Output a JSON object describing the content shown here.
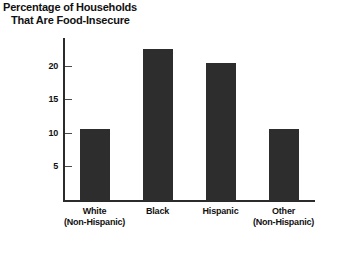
{
  "chart_data": {
    "type": "bar",
    "title": "Percentage of Households That Are Food-Insecure",
    "title_line1": "Percentage of Households",
    "title_line2": "That Are Food-Insecure",
    "xlabel": "",
    "ylabel": "",
    "ylim": [
      0,
      22.5
    ],
    "yticks": [
      5,
      10,
      15,
      20
    ],
    "ytick_labels": [
      "5",
      "10",
      "15",
      "20"
    ],
    "grid": false,
    "legend": false,
    "categories": [
      "White (Non-Hispanic)",
      "Black",
      "Hispanic",
      "Other (Non-Hispanic)"
    ],
    "category_lines": [
      {
        "main": "White",
        "sub": "(Non-Hispanic)"
      },
      {
        "main": "Black",
        "sub": ""
      },
      {
        "main": "Hispanic",
        "sub": ""
      },
      {
        "main": "Other",
        "sub": "(Non-Hispanic)"
      }
    ],
    "values": [
      10,
      21,
      19,
      10
    ],
    "bar_color": "#2d2d2d",
    "axis_color": "#2b2b2b",
    "background": "#ffffff"
  }
}
